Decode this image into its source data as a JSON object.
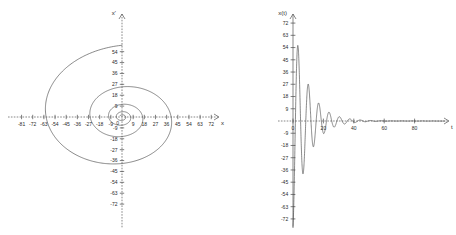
{
  "figure": {
    "panels": [
      {
        "id": "phase-portrait",
        "yaxis_label": "x'",
        "xaxis_label": "x",
        "origin_label": "0"
      },
      {
        "id": "time-series",
        "yaxis_label": "x(t)",
        "xaxis_label": "t",
        "origin_label": "0"
      }
    ]
  },
  "chart_data": [
    {
      "type": "line",
      "id": "phase-portrait",
      "title": "",
      "xlabel": "x",
      "ylabel": "x'",
      "xlim": [
        -90,
        90
      ],
      "ylim": [
        -78,
        60
      ],
      "grid": false,
      "legend": "none",
      "xticks": [
        -81,
        -72,
        -63,
        -54,
        -45,
        -36,
        -27,
        -18,
        -9,
        0,
        9,
        18,
        27,
        36,
        45,
        54,
        63,
        72,
        81
      ],
      "xticklabels": [
        "-81",
        "-72",
        "-63",
        "-54",
        "-45",
        "-36",
        "-27",
        "-18",
        "-9",
        "0",
        "9",
        "18",
        "27",
        "36",
        "45",
        "54",
        "63",
        "72",
        "81"
      ],
      "yticks": [
        54,
        45,
        36,
        27,
        18,
        9,
        0,
        -9,
        -18,
        -27,
        -36,
        -45,
        -54,
        -63,
        -72
      ],
      "yticklabels": [
        "54",
        "45",
        "36",
        "27",
        "18",
        "9",
        "0",
        "-9",
        "-18",
        "-27",
        "-36",
        "-45",
        "-54",
        "-63",
        "-72"
      ],
      "description": "Inward spiral trajectory converging to the origin (stable focus of a damped oscillator).",
      "spiral": {
        "param": "theta",
        "theta_start": 0.0,
        "theta_end": 26.0,
        "r0": 76.0,
        "decay_per_turn": 0.42,
        "x_scale": 1.0,
        "y_scale": 0.78,
        "phase_offset": 1.5708
      },
      "series": [
        {
          "name": "trajectory",
          "x": [
            0,
            -14,
            -40,
            -64,
            -78,
            -80,
            -68,
            -44,
            -14,
            16,
            40,
            54,
            56,
            47,
            30,
            10,
            -10,
            -25,
            -33,
            -33,
            -27,
            -16,
            -3,
            9,
            18,
            22,
            21,
            16,
            9,
            1,
            -6,
            -11,
            -13,
            -12,
            -9,
            -4,
            1,
            5,
            7,
            7,
            5,
            2,
            -1,
            -3,
            -4,
            -4,
            -3,
            -1,
            0,
            1,
            2,
            2,
            1,
            0,
            0
          ],
          "y": [
            45,
            43,
            36,
            22,
            4,
            -14,
            -30,
            -41,
            -45,
            -42,
            -33,
            -19,
            -3,
            11,
            22,
            27,
            26,
            21,
            12,
            1,
            -9,
            -16,
            -19,
            -18,
            -14,
            -7,
            1,
            7,
            11,
            12,
            11,
            7,
            2,
            -3,
            -6,
            -8,
            -7,
            -5,
            -2,
            1,
            4,
            5,
            5,
            3,
            1,
            -1,
            -3,
            -3,
            -3,
            -2,
            0,
            1,
            2,
            1,
            0
          ]
        }
      ]
    },
    {
      "type": "line",
      "id": "time-series",
      "title": "",
      "xlabel": "t",
      "ylabel": "x(t)",
      "xlim": [
        -6,
        102
      ],
      "ylim": [
        -78,
        78
      ],
      "grid": false,
      "legend": "none",
      "xticks": [
        0,
        20,
        40,
        60,
        80
      ],
      "xticklabels": [
        "0",
        "20",
        "40",
        "60",
        "80"
      ],
      "yticks": [
        72,
        63,
        54,
        45,
        36,
        27,
        18,
        9,
        0,
        -9,
        -18,
        -27,
        -36,
        -45,
        -54,
        -63,
        -72
      ],
      "yticklabels": [
        "72",
        "63",
        "54",
        "45",
        "36",
        "27",
        "18",
        "9",
        "0",
        "-9",
        "-18",
        "-27",
        "-36",
        "-45",
        "-54",
        "-63",
        "-72"
      ],
      "description": "Exponentially damped sinusoid: large negative initial excursion near -72, first positive peak about +47, amplitude decaying to zero near t = 60.",
      "damped_sine": {
        "amplitude": 78.0,
        "decay_rate": 0.105,
        "angular_frequency": 0.92,
        "phase": -1.45,
        "t_start": 0.0,
        "t_end": 100.0
      },
      "series": [
        {
          "name": "x(t)",
          "t": [
            0,
            1,
            2,
            3,
            4,
            5,
            6,
            7,
            8,
            9,
            10,
            11,
            12,
            13,
            14,
            15,
            16,
            17,
            18,
            19,
            20,
            21,
            22,
            23,
            24,
            25,
            26,
            27,
            28,
            29,
            30,
            31,
            32,
            33,
            34,
            35,
            36,
            37,
            38,
            39,
            40,
            42,
            44,
            46,
            48,
            50,
            52,
            54,
            56,
            58,
            60,
            65,
            70,
            75,
            80,
            85,
            90,
            95,
            100
          ],
          "values": [
            -2,
            -30,
            -58,
            -72,
            -70,
            -53,
            -25,
            8,
            33,
            45,
            47,
            38,
            21,
            0,
            -18,
            -31,
            -35,
            -31,
            -20,
            -5,
            10,
            21,
            26,
            24,
            17,
            6,
            -5,
            -14,
            -19,
            -19,
            -14,
            -6,
            2,
            9,
            13,
            13,
            10,
            4,
            -2,
            -7,
            -10,
            -9,
            -3,
            4,
            7,
            6,
            1,
            -3,
            -5,
            -4,
            -1,
            2,
            1,
            -1,
            0,
            0,
            0,
            0,
            0
          ]
        }
      ]
    }
  ]
}
